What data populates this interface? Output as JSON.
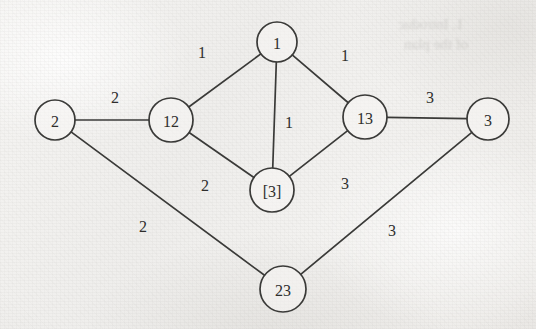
{
  "figure": {
    "kind": "weighted-undirected-graph",
    "background_color": "#f0efed",
    "ink_color": "#3a3a38",
    "ghost_text": [
      {
        "text": "1. Introduc",
        "x": 398,
        "y": 16,
        "size": 15
      },
      {
        "text": "of the plan",
        "x": 404,
        "y": 36,
        "size": 15
      }
    ]
  },
  "graph_data": {
    "type": "graph",
    "nodes": [
      {
        "id": "n1",
        "label": "1",
        "cx": 277,
        "cy": 42,
        "r": 20
      },
      {
        "id": "n2",
        "label": "2",
        "cx": 55,
        "cy": 120,
        "r": 20
      },
      {
        "id": "n12",
        "label": "12",
        "cx": 171,
        "cy": 120,
        "r": 22
      },
      {
        "id": "n13",
        "label": "13",
        "cx": 365,
        "cy": 117,
        "r": 22
      },
      {
        "id": "n3",
        "label": "3",
        "cx": 488,
        "cy": 119,
        "r": 21
      },
      {
        "id": "nb3",
        "label": "[3]",
        "cx": 272,
        "cy": 190,
        "r": 22
      },
      {
        "id": "n23",
        "label": "23",
        "cx": 283,
        "cy": 289,
        "r": 23
      }
    ],
    "edges": [
      {
        "source": "n1",
        "target": "n12",
        "weight": "1",
        "lx": 202,
        "ly": 52
      },
      {
        "source": "n1",
        "target": "n13",
        "weight": "1",
        "lx": 345,
        "ly": 55
      },
      {
        "source": "n1",
        "target": "nb3",
        "weight": "1",
        "lx": 289,
        "ly": 122
      },
      {
        "source": "n2",
        "target": "n12",
        "weight": "2",
        "lx": 115,
        "ly": 97
      },
      {
        "source": "n12",
        "target": "nb3",
        "weight": "2",
        "lx": 205,
        "ly": 185
      },
      {
        "source": "nb3",
        "target": "n13",
        "weight": "3",
        "lx": 345,
        "ly": 183
      },
      {
        "source": "n13",
        "target": "n3",
        "weight": "3",
        "lx": 430,
        "ly": 97
      },
      {
        "source": "n2",
        "target": "n23",
        "weight": "2",
        "lx": 143,
        "ly": 226
      },
      {
        "source": "n23",
        "target": "n3",
        "weight": "3",
        "lx": 392,
        "ly": 230
      }
    ]
  }
}
